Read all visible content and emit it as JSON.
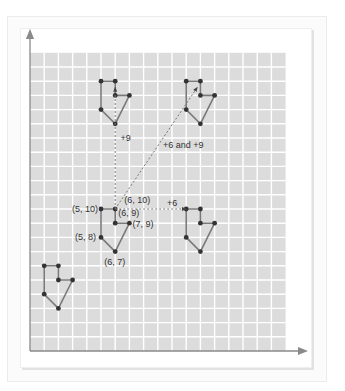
{
  "diagram": {
    "title": "",
    "grid": {
      "cols": 18,
      "rows": 21,
      "cell_px": 14.2,
      "origin_px": [
        30,
        351
      ],
      "fill_color": "#dcdcdc",
      "line_color": "#ffffff"
    },
    "axes": {
      "color": "#8a8a8a",
      "x_arrow": true,
      "y_arrow": true
    },
    "shape_style": {
      "stroke": "#7a7a7a",
      "vertex_color": "#333333"
    },
    "original_shape": {
      "name": "original",
      "vertices": [
        [
          5,
          10
        ],
        [
          6,
          10
        ],
        [
          6,
          9
        ],
        [
          7,
          9
        ],
        [
          6,
          7
        ],
        [
          5,
          8
        ]
      ],
      "labels": [
        {
          "text": "(5, 10)",
          "at": [
            5,
            10
          ]
        },
        {
          "text": "(6, 10)",
          "at": [
            6,
            10
          ]
        },
        {
          "text": "(6, 9)",
          "at": [
            6,
            9
          ]
        },
        {
          "text": "(7, 9)",
          "at": [
            7,
            9
          ]
        },
        {
          "text": "(5, 8)",
          "at": [
            5,
            8
          ]
        },
        {
          "text": "(6, 7)",
          "at": [
            6,
            7
          ]
        }
      ]
    },
    "translated_shapes": [
      {
        "name": "translate-up-9",
        "dx": 0,
        "dy": 9
      },
      {
        "name": "translate-right-6-up-9",
        "dx": 6,
        "dy": 9
      },
      {
        "name": "translate-right-6",
        "dx": 6,
        "dy": 0
      },
      {
        "name": "translate-left-4-down-4",
        "dx": -4,
        "dy": -4
      }
    ],
    "arrows": [
      {
        "name": "arrow-up-9",
        "from": [
          6,
          10
        ],
        "to": [
          6,
          19
        ],
        "label": "+9",
        "label_pos": [
          120.5,
          141
        ]
      },
      {
        "name": "arrow-diagonal",
        "from": [
          6,
          10
        ],
        "to": [
          12,
          19
        ],
        "label": "+6 and +9",
        "label_pos": [
          163,
          148
        ]
      },
      {
        "name": "arrow-right-6",
        "from": [
          6,
          10
        ],
        "to": [
          11,
          10
        ],
        "label": "+6",
        "label_pos": [
          167,
          206
        ]
      }
    ]
  }
}
